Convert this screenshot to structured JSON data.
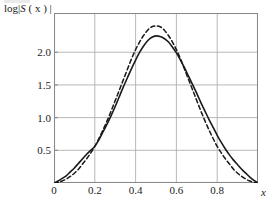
{
  "figure": {
    "background": "#ffffff",
    "frame_color": "#8a8a8a",
    "grid_color": "#b0b0b0",
    "curve_color": "#1a1a1a"
  },
  "axis": {
    "ylabel_prefix": "log|",
    "ylabel_var": "S",
    "ylabel_arg": " ( x ) ",
    "ylabel_suffix": "|",
    "xlabel": "x",
    "yticks": [
      "0.5",
      "1.0",
      "1.5",
      "2.0"
    ],
    "xticks": [
      "0",
      "0.2",
      "0.4",
      "0.6",
      "0.8"
    ]
  },
  "chart_data": {
    "type": "line",
    "title": "",
    "xlabel": "x",
    "ylabel": "log|S ( x ) |",
    "xlim": [
      0,
      1
    ],
    "ylim": [
      0,
      2.6
    ],
    "xticks": [
      0,
      0.2,
      0.4,
      0.6,
      0.8
    ],
    "yticks": [
      0.5,
      1.0,
      1.5,
      2.0
    ],
    "grid": true,
    "legend": "none",
    "series": [
      {
        "name": "solid curve",
        "style": "solid",
        "color": "#1a1a1a",
        "x": [
          0.0,
          0.02,
          0.04,
          0.06,
          0.08,
          0.1,
          0.12,
          0.14,
          0.16,
          0.18,
          0.2,
          0.22,
          0.24,
          0.26,
          0.28,
          0.3,
          0.32,
          0.34,
          0.36,
          0.38,
          0.4,
          0.42,
          0.44,
          0.46,
          0.48,
          0.5,
          0.52,
          0.54,
          0.56,
          0.58,
          0.6,
          0.62,
          0.64,
          0.66,
          0.68,
          0.7,
          0.72,
          0.74,
          0.76,
          0.78,
          0.8,
          0.82,
          0.84,
          0.86,
          0.88,
          0.9,
          0.92,
          0.94,
          0.96,
          0.98,
          1.0
        ],
        "y": [
          0.0,
          0.03,
          0.07,
          0.11,
          0.17,
          0.23,
          0.3,
          0.37,
          0.44,
          0.5,
          0.56,
          0.66,
          0.78,
          0.9,
          1.03,
          1.17,
          1.32,
          1.47,
          1.61,
          1.75,
          1.88,
          2.0,
          2.1,
          2.18,
          2.23,
          2.25,
          2.24,
          2.21,
          2.16,
          2.08,
          1.99,
          1.88,
          1.76,
          1.63,
          1.5,
          1.37,
          1.23,
          1.1,
          0.97,
          0.85,
          0.73,
          0.62,
          0.52,
          0.43,
          0.35,
          0.28,
          0.21,
          0.15,
          0.09,
          0.04,
          0.0
        ]
      },
      {
        "name": "dashed curve",
        "style": "dashed",
        "color": "#1a1a1a",
        "x": [
          0.0,
          0.02,
          0.04,
          0.06,
          0.08,
          0.1,
          0.12,
          0.14,
          0.16,
          0.18,
          0.2,
          0.22,
          0.24,
          0.26,
          0.28,
          0.3,
          0.32,
          0.34,
          0.36,
          0.38,
          0.4,
          0.42,
          0.44,
          0.46,
          0.48,
          0.5,
          0.52,
          0.54,
          0.56,
          0.58,
          0.6,
          0.62,
          0.64,
          0.66,
          0.68,
          0.7,
          0.72,
          0.74,
          0.76,
          0.78,
          0.8,
          0.82,
          0.84,
          0.86,
          0.88,
          0.9,
          0.92,
          0.94,
          0.96,
          0.98,
          1.0
        ],
        "y": [
          0.0,
          0.01,
          0.03,
          0.06,
          0.1,
          0.15,
          0.21,
          0.29,
          0.37,
          0.46,
          0.56,
          0.68,
          0.81,
          0.95,
          1.1,
          1.26,
          1.42,
          1.58,
          1.74,
          1.9,
          2.04,
          2.16,
          2.26,
          2.34,
          2.39,
          2.4,
          2.39,
          2.34,
          2.26,
          2.16,
          2.04,
          1.9,
          1.74,
          1.58,
          1.42,
          1.26,
          1.1,
          0.95,
          0.81,
          0.68,
          0.56,
          0.46,
          0.37,
          0.29,
          0.21,
          0.15,
          0.1,
          0.06,
          0.03,
          0.01,
          0.0
        ]
      }
    ]
  }
}
